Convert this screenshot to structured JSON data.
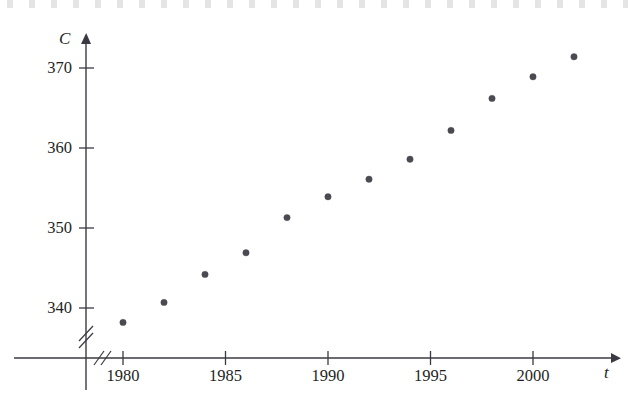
{
  "figure": {
    "background_color": "#ffffff",
    "ink_color": "#3a3a42",
    "point_color": "#4a4a52"
  },
  "chart_data": {
    "type": "scatter",
    "title": "",
    "subtitle": "",
    "xlabel": "t",
    "ylabel": "C",
    "xlabel_full": "t (year)",
    "ylabel_full": "C (average CO2 level, parts per million)",
    "x": [
      1980,
      1982,
      1984,
      1986,
      1988,
      1990,
      1992,
      1994,
      1996,
      1998,
      2000,
      2002
    ],
    "values": [
      338.2,
      340.7,
      344.2,
      346.9,
      351.3,
      353.9,
      356.1,
      358.6,
      362.2,
      366.2,
      368.9,
      371.4
    ],
    "xlim": [
      1978.3,
      2004.0
    ],
    "ylim": [
      336.0,
      374.0
    ],
    "x_ticks": [
      1980,
      1985,
      1990,
      1995,
      2000
    ],
    "x_tick_labels": [
      "1980",
      "1985",
      "1990",
      "1995",
      "2000"
    ],
    "y_ticks": [
      340,
      350,
      360,
      370
    ],
    "y_tick_labels": [
      "340",
      "350",
      "360",
      "370"
    ],
    "grid": false,
    "legend": false,
    "axis_break_x": true,
    "axis_break_y": true,
    "marker": "filled-circle",
    "marker_size": 3.2
  }
}
